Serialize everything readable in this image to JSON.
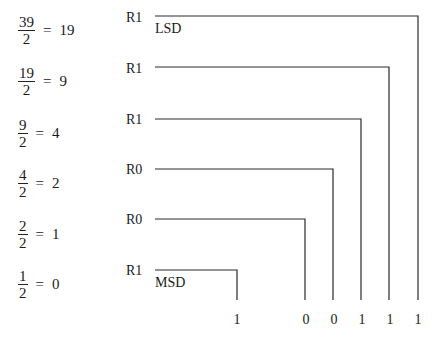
{
  "steps": [
    {
      "numerator": "39",
      "denominator": "2",
      "equals": "=",
      "quotient": "19",
      "remainder": "R1"
    },
    {
      "numerator": "19",
      "denominator": "2",
      "equals": "=",
      "quotient": "9",
      "remainder": "R1"
    },
    {
      "numerator": "9",
      "denominator": "2",
      "equals": "=",
      "quotient": "4",
      "remainder": "R1"
    },
    {
      "numerator": "4",
      "denominator": "2",
      "equals": "=",
      "quotient": "2",
      "remainder": "R0"
    },
    {
      "numerator": "2",
      "denominator": "2",
      "equals": "=",
      "quotient": "1",
      "remainder": "R0"
    },
    {
      "numerator": "1",
      "denominator": "2",
      "equals": "=",
      "quotient": "0",
      "remainder": "R1"
    }
  ],
  "labels": {
    "lsd": "LSD",
    "msd": "MSD"
  },
  "result_digits": [
    "1",
    "0",
    "0",
    "1",
    "1",
    "1"
  ],
  "line_color": "#2a2a2a"
}
